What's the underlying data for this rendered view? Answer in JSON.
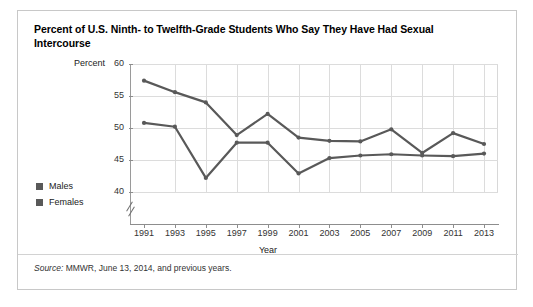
{
  "figure": {
    "title": "Percent of U.S. Ninth- to Twelfth-Grade Students Who Say They Have Had Sexual Intercourse",
    "source_prefix": "Source:",
    "source_text": " MMWR, June 13, 2014, and previous years."
  },
  "legend": {
    "position": "left",
    "items": [
      {
        "label": "Males",
        "color": "#595959"
      },
      {
        "label": "Females",
        "color": "#595959"
      }
    ]
  },
  "chart_data": {
    "type": "line",
    "title": "Percent of U.S. Ninth- to Twelfth-Grade Students Who Say They Have Had Sexual Intercourse",
    "xlabel": "Year",
    "ylabel": "Percent",
    "categories": [
      1991,
      1993,
      1995,
      1997,
      1999,
      2001,
      2003,
      2005,
      2007,
      2009,
      2011,
      2013
    ],
    "x": [
      1991,
      1993,
      1995,
      1997,
      1999,
      2001,
      2003,
      2005,
      2007,
      2009,
      2011,
      2013
    ],
    "xtick_labels": [
      "1991",
      "1993",
      "1995",
      "1997",
      "1999",
      "2001",
      "2003",
      "2005",
      "2007",
      "2009",
      "2011",
      "2013"
    ],
    "ytick_labels": [
      "60",
      "55",
      "50",
      "45",
      "40"
    ],
    "yticks": [
      60,
      55,
      50,
      45,
      40
    ],
    "ylim": [
      40,
      60
    ],
    "xlim": [
      1991,
      2013
    ],
    "axis_break": true,
    "axis_break_note": "y-axis broken below 40",
    "grid": true,
    "legend_position": "left",
    "series": [
      {
        "name": "Males",
        "color": "#595959",
        "values": [
          57.4,
          55.6,
          54.0,
          48.9,
          52.2,
          48.5,
          48.0,
          47.9,
          49.8,
          46.1,
          49.2,
          47.5
        ]
      },
      {
        "name": "Females",
        "color": "#595959",
        "values": [
          50.8,
          50.2,
          42.2,
          47.7,
          47.7,
          42.9,
          45.3,
          45.7,
          45.9,
          45.7,
          45.6,
          46.0
        ]
      }
    ]
  }
}
